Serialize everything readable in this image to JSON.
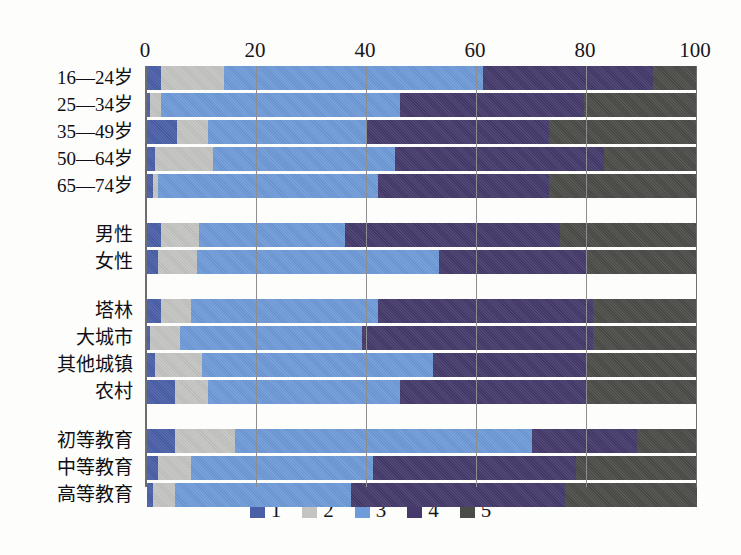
{
  "chart_data": {
    "type": "bar",
    "orientation": "horizontal",
    "stacked": true,
    "stack_mode": "percent",
    "title": "",
    "xlabel": "",
    "ylabel": "",
    "xlim": [
      0,
      100
    ],
    "xticks": [
      0,
      20,
      40,
      60,
      80,
      100
    ],
    "xtick_labels": [
      "0",
      "20",
      "40",
      "60",
      "80",
      "100"
    ],
    "grid": true,
    "grid_axis": "x",
    "legend": {
      "position": "bottom",
      "entries": [
        {
          "label": "1",
          "color": "#4a5fa8"
        },
        {
          "label": "2",
          "color": "#c4c4c2"
        },
        {
          "label": "3",
          "color": "#6f9bd8"
        },
        {
          "label": "4",
          "color": "#453a6b"
        },
        {
          "label": "5",
          "color": "#4b4b48"
        }
      ]
    },
    "groups": [
      {
        "name": "age",
        "categories": [
          "16—24岁",
          "25—34岁",
          "35—49岁",
          "50—64岁",
          "65—74岁"
        ]
      },
      {
        "name": "gender",
        "categories": [
          "男性",
          "女性"
        ]
      },
      {
        "name": "location",
        "categories": [
          "塔林",
          "大城市",
          "其他城镇",
          "农村"
        ]
      },
      {
        "name": "education",
        "categories": [
          "初等教育",
          "中等教育",
          "高等教育"
        ]
      }
    ],
    "categories": [
      "16—24岁",
      "25—34岁",
      "35—49岁",
      "50—64岁",
      "65—74岁",
      "男性",
      "女性",
      "塔林",
      "大城市",
      "其他城镇",
      "农村",
      "初等教育",
      "中等教育",
      "高等教育"
    ],
    "series": [
      {
        "name": "1",
        "color": "#4a5fa8",
        "values": [
          2.5,
          0.5,
          5.5,
          1.5,
          1.0,
          2.5,
          2.0,
          2.5,
          0.5,
          1.5,
          5.0,
          5.0,
          2.0,
          1.0
        ]
      },
      {
        "name": "2",
        "color": "#c4c4c2",
        "values": [
          11.5,
          2.0,
          5.5,
          10.5,
          1.0,
          7.0,
          7.0,
          5.5,
          5.5,
          8.5,
          6.0,
          11.0,
          6.0,
          4.0
        ]
      },
      {
        "name": "3",
        "color": "#6f9bd8",
        "values": [
          47.0,
          43.5,
          29.0,
          33.0,
          40.0,
          26.5,
          44.0,
          34.0,
          33.0,
          42.0,
          35.0,
          54.0,
          33.0,
          32.0
        ]
      },
      {
        "name": "4",
        "color": "#453a6b",
        "values": [
          31.0,
          33.5,
          33.0,
          38.0,
          31.0,
          39.0,
          27.0,
          39.0,
          42.0,
          28.0,
          34.0,
          19.0,
          37.0,
          39.0
        ]
      },
      {
        "name": "5",
        "color": "#4b4b48",
        "values": [
          8.0,
          20.5,
          27.0,
          17.0,
          27.0,
          25.0,
          20.0,
          19.0,
          19.0,
          20.0,
          20.0,
          11.0,
          22.0,
          24.0
        ]
      }
    ]
  }
}
